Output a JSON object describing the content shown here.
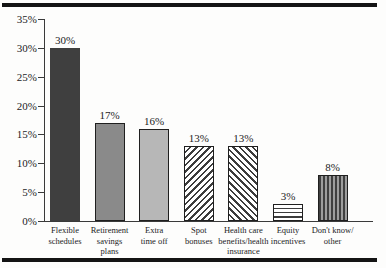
{
  "figure": {
    "background": "#fdfdfc",
    "rule_color": "#141414"
  },
  "chart_data": {
    "type": "bar",
    "title": "",
    "xlabel": "",
    "ylabel": "",
    "ylim": [
      0,
      35
    ],
    "ytick_step": 5,
    "ytick_labels": [
      "0%",
      "5%",
      "10%",
      "15%",
      "20%",
      "25%",
      "30%",
      "35%"
    ],
    "grid": false,
    "legend_position": "none",
    "categories": [
      "Flexible schedules",
      "Retirement savings plans",
      "Extra time off",
      "Spot bonuses",
      "Health care benefits/health insurance",
      "Equity incentives",
      "Don't know/other"
    ],
    "values": [
      30,
      17,
      16,
      13,
      13,
      3,
      8
    ],
    "bars": [
      {
        "category_lines": [
          "Flexible",
          "schedules"
        ],
        "value": 30,
        "label": "30%",
        "pattern": "solid-dark"
      },
      {
        "category_lines": [
          "Retirement",
          "savings",
          "plans"
        ],
        "value": 17,
        "label": "17%",
        "pattern": "solid-medium"
      },
      {
        "category_lines": [
          "Extra",
          "time off"
        ],
        "value": 16,
        "label": "16%",
        "pattern": "solid-light"
      },
      {
        "category_lines": [
          "Spot",
          "bonuses"
        ],
        "value": 13,
        "label": "13%",
        "pattern": "hatch-diagonal-up"
      },
      {
        "category_lines": [
          "Health care",
          "benefits/health",
          "insurance"
        ],
        "value": 13,
        "label": "13%",
        "pattern": "hatch-diagonal-down"
      },
      {
        "category_lines": [
          "Equity",
          "incentives"
        ],
        "value": 3,
        "label": "3%",
        "pattern": "hatch-horizontal"
      },
      {
        "category_lines": [
          "Don't know/",
          "other"
        ],
        "value": 8,
        "label": "8%",
        "pattern": "stripe-vertical"
      }
    ],
    "colors": {
      "solid_dark": "#3f3f3f",
      "solid_medium": "#8a8a8a",
      "solid_light": "#b7b7b7",
      "hatch_line": "#3c3c3c",
      "bar_border": "#1f1f1f",
      "stripe_bg": "#9d9d9d",
      "stripe_dark": "#3f3f3f",
      "axis_color": "#3a3a3a"
    }
  }
}
